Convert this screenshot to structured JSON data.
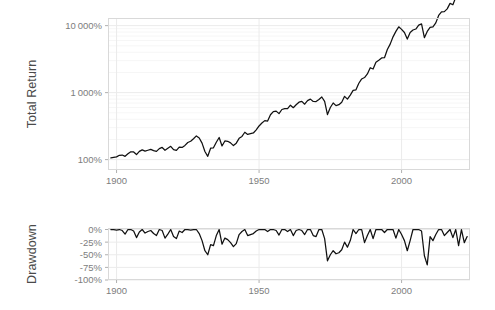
{
  "figure": {
    "background": "#ffffff",
    "line_color": "#111111",
    "grid_color": "#ebebeb",
    "panel_border_color": "#d9d9d9",
    "tick_text_color": "#7d7d7d",
    "axis_title_color": "#4a4a4a"
  },
  "panels": {
    "top": {
      "x": 108,
      "y": 18,
      "width": 362,
      "height": 152
    },
    "bottom": {
      "x": 108,
      "y": 228,
      "width": 362,
      "height": 52
    }
  },
  "chart_data": [
    {
      "type": "line",
      "title": "",
      "subtitle": "",
      "xlabel": "",
      "ylabel": "Total Return",
      "yscale": "log",
      "ylim": [
        70,
        13000
      ],
      "xlim": [
        1897,
        2024
      ],
      "grid": true,
      "legend": "none",
      "y_ticks": [
        100,
        1000,
        10000
      ],
      "y_ticklabels": [
        "100%",
        "1 000%",
        "10 000%"
      ],
      "y_minor_ticks": [
        200,
        300,
        400,
        500,
        600,
        700,
        800,
        900,
        2000,
        3000,
        4000,
        5000,
        6000,
        7000,
        8000,
        9000
      ],
      "x_ticks": [
        1900,
        1950,
        2000
      ],
      "x_ticklabels": [
        "1900",
        "1950",
        "2000"
      ],
      "series": [
        {
          "name": "Total Return",
          "x": [
            1898,
            1899,
            1900,
            1901,
            1902,
            1903,
            1904,
            1905,
            1906,
            1907,
            1908,
            1909,
            1910,
            1911,
            1912,
            1913,
            1914,
            1915,
            1916,
            1917,
            1918,
            1919,
            1920,
            1921,
            1922,
            1923,
            1924,
            1925,
            1926,
            1927,
            1928,
            1929,
            1930,
            1931,
            1932,
            1933,
            1934,
            1935,
            1936,
            1937,
            1938,
            1939,
            1940,
            1941,
            1942,
            1943,
            1944,
            1945,
            1946,
            1947,
            1948,
            1949,
            1950,
            1951,
            1952,
            1953,
            1954,
            1955,
            1956,
            1957,
            1958,
            1959,
            1960,
            1961,
            1962,
            1963,
            1964,
            1965,
            1966,
            1967,
            1968,
            1969,
            1970,
            1971,
            1972,
            1973,
            1974,
            1975,
            1976,
            1977,
            1978,
            1979,
            1980,
            1981,
            1982,
            1983,
            1984,
            1985,
            1986,
            1987,
            1988,
            1989,
            1990,
            1991,
            1992,
            1993,
            1994,
            1995,
            1996,
            1997,
            1998,
            1999,
            2000,
            2001,
            2002,
            2003,
            2004,
            2005,
            2006,
            2007,
            2008,
            2009,
            2010,
            2011,
            2012,
            2013,
            2014,
            2015,
            2016,
            2017,
            2018,
            2019,
            2020,
            2021,
            2022,
            2023
          ],
          "y": [
            106,
            108,
            110,
            116,
            117,
            112,
            122,
            131,
            130,
            119,
            133,
            140,
            134,
            138,
            142,
            136,
            133,
            146,
            152,
            138,
            148,
            158,
            141,
            137,
            154,
            152,
            163,
            180,
            188,
            205,
            226,
            210,
            176,
            132,
            112,
            148,
            150,
            182,
            214,
            160,
            190,
            188,
            178,
            162,
            176,
            208,
            222,
            256,
            238,
            244,
            250,
            278,
            318,
            352,
            382,
            376,
            468,
            520,
            530,
            486,
            560,
            578,
            576,
            650,
            596,
            658,
            720,
            740,
            672,
            760,
            800,
            740,
            736,
            790,
            860,
            740,
            470,
            600,
            700,
            640,
            660,
            720,
            880,
            800,
            920,
            1080,
            1100,
            1380,
            1600,
            1680,
            1900,
            2350,
            2250,
            2850,
            3050,
            3300,
            3320,
            4400,
            5300,
            6800,
            8200,
            9600,
            8800,
            7900,
            6300,
            7900,
            8600,
            8900,
            10200,
            10600,
            6600,
            8200,
            9400,
            9600,
            11000,
            14200,
            16000,
            16200,
            17800,
            21500,
            20500,
            26500,
            31000,
            39000,
            32000,
            39500
          ]
        }
      ]
    },
    {
      "type": "line",
      "title": "",
      "subtitle": "",
      "xlabel": "",
      "ylabel": "Drawdown",
      "yscale": "linear",
      "ylim": [
        -100,
        3
      ],
      "xlim": [
        1897,
        2024
      ],
      "grid": true,
      "legend": "none",
      "y_ticks": [
        0,
        -25,
        -50,
        -75,
        -100
      ],
      "y_ticklabels": [
        "0%",
        "-25%",
        "-50%",
        "-75%",
        "-100%"
      ],
      "x_ticks": [
        1900,
        1950,
        2000
      ],
      "x_ticklabels": [
        "1900",
        "1950",
        "2000"
      ],
      "series": [
        {
          "name": "Drawdown",
          "x": [
            1898,
            1899,
            1900,
            1901,
            1902,
            1903,
            1904,
            1905,
            1906,
            1907,
            1908,
            1909,
            1910,
            1911,
            1912,
            1913,
            1914,
            1915,
            1916,
            1917,
            1918,
            1919,
            1920,
            1921,
            1922,
            1923,
            1924,
            1925,
            1926,
            1927,
            1928,
            1929,
            1930,
            1931,
            1932,
            1933,
            1934,
            1935,
            1936,
            1937,
            1938,
            1939,
            1940,
            1941,
            1942,
            1943,
            1944,
            1945,
            1946,
            1947,
            1948,
            1949,
            1950,
            1951,
            1952,
            1953,
            1954,
            1955,
            1956,
            1957,
            1958,
            1959,
            1960,
            1961,
            1962,
            1963,
            1964,
            1965,
            1966,
            1967,
            1968,
            1969,
            1970,
            1971,
            1972,
            1973,
            1974,
            1975,
            1976,
            1977,
            1978,
            1979,
            1980,
            1981,
            1982,
            1983,
            1984,
            1985,
            1986,
            1987,
            1988,
            1989,
            1990,
            1991,
            1992,
            1993,
            1994,
            1995,
            1996,
            1997,
            1998,
            1999,
            2000,
            2001,
            2002,
            2003,
            2004,
            2005,
            2006,
            2007,
            2008,
            2009,
            2010,
            2011,
            2012,
            2013,
            2014,
            2015,
            2016,
            2017,
            2018,
            2019,
            2020,
            2021,
            2022,
            2023
          ],
          "y": [
            0,
            0,
            -1,
            0,
            -2,
            -9,
            0,
            0,
            -3,
            -16,
            -5,
            0,
            -7,
            -4,
            -2,
            -8,
            -12,
            0,
            -2,
            -17,
            -9,
            0,
            -14,
            -18,
            -3,
            -6,
            0,
            0,
            -1,
            0,
            0,
            -8,
            -22,
            -42,
            -50,
            -30,
            -32,
            -12,
            0,
            -29,
            -17,
            -20,
            -26,
            -34,
            -28,
            -10,
            -4,
            0,
            -12,
            -10,
            -8,
            -3,
            0,
            0,
            0,
            -4,
            0,
            0,
            -2,
            -11,
            0,
            0,
            -4,
            0,
            -12,
            -2,
            0,
            -2,
            -10,
            0,
            0,
            -12,
            -14,
            0,
            0,
            -18,
            -62,
            -50,
            -42,
            -48,
            -46,
            -40,
            -25,
            -35,
            -22,
            0,
            -8,
            0,
            0,
            -26,
            -12,
            0,
            -18,
            0,
            0,
            0,
            -6,
            0,
            0,
            0,
            -17,
            0,
            -10,
            -22,
            -42,
            -22,
            0,
            0,
            0,
            -3,
            -52,
            -70,
            -14,
            -22,
            -10,
            0,
            0,
            -12,
            -6,
            0,
            -16,
            0,
            -32,
            0,
            -26,
            -14
          ]
        }
      ]
    }
  ],
  "axis_titles": {
    "total_return": "Total Return",
    "drawdown": "Drawdown"
  }
}
